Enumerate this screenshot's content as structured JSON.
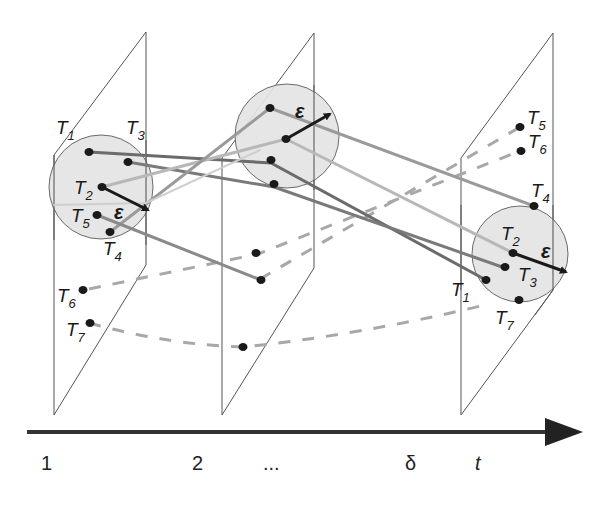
{
  "diagram": {
    "type": "trajectory-clustering-over-time",
    "colors": {
      "plane_stroke": "#555555",
      "circle_fill": "#e3e3e3",
      "circle_stroke": "#6a6a6a",
      "trajectory_dark": "#6b6b6b",
      "trajectory_light": "#b0b0b0",
      "dashed_trajectory": "#a8a8a8",
      "point": "#1a1a1a",
      "epsilon_arrow": "#1a1a1a",
      "axis": "#333333"
    },
    "planes": [
      {
        "id": "plane-1",
        "time_label": "1"
      },
      {
        "id": "plane-2",
        "time_label": "2"
      },
      {
        "id": "plane-3",
        "time_label": "δ"
      }
    ],
    "epsilon_symbol": "ε",
    "plane1_labels": {
      "T1": {
        "main": "T",
        "sub": "1"
      },
      "T2": {
        "main": "T",
        "sub": "2"
      },
      "T3": {
        "main": "T",
        "sub": "3"
      },
      "T4": {
        "main": "T",
        "sub": "4"
      },
      "T5": {
        "main": "T",
        "sub": "5"
      },
      "T6": {
        "main": "T",
        "sub": "6"
      },
      "T7": {
        "main": "T",
        "sub": "7"
      }
    },
    "plane3_labels": {
      "T1": {
        "main": "T",
        "sub": "1"
      },
      "T2": {
        "main": "T",
        "sub": "2"
      },
      "T3": {
        "main": "T",
        "sub": "3"
      },
      "T4": {
        "main": "T",
        "sub": "4"
      },
      "T5": {
        "main": "T",
        "sub": "5"
      },
      "T6": {
        "main": "T",
        "sub": "6"
      },
      "T7": {
        "main": "T",
        "sub": "7"
      }
    },
    "time_axis": {
      "ticks": [
        "1",
        "2",
        "...",
        "δ"
      ],
      "axis_label": "t"
    }
  }
}
